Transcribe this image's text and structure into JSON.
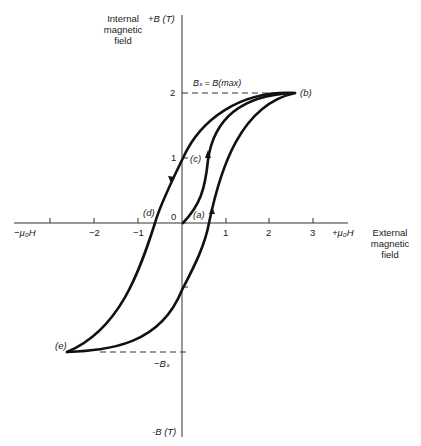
{
  "y_axis": {
    "title_lines": [
      "Internal",
      "magnetic",
      "field"
    ],
    "top_label": "+B (T)",
    "bottom_label": "-B (T)",
    "ticks": [
      "2",
      "1"
    ]
  },
  "x_axis": {
    "title_lines": [
      "External",
      "magnetic",
      "field"
    ],
    "right_label": "+μ₀H",
    "left_label": "−μ₀H",
    "ticks": [
      "−2",
      "−1",
      "1",
      "2",
      "3"
    ],
    "origin": "0"
  },
  "annotations": {
    "bs_max": "Bₛ = B(max)",
    "neg_bs": "−Bₛ",
    "point_a": "(a)",
    "point_b": "(b)",
    "point_c": "(c)",
    "point_d": "(d)",
    "point_e": "(e)"
  },
  "colors": {
    "curve": "#111111",
    "axis": "#333333"
  }
}
